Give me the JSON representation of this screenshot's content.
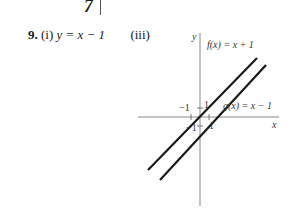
{
  "page_fragment": {
    "top_glyph": "7"
  },
  "problem": {
    "number": "9.",
    "part_i_label": "(i)",
    "part_i_answer": "y = x − 1",
    "part_iii_label": "(iii)"
  },
  "graph": {
    "y_axis_label": "y",
    "x_axis_label": "x",
    "f_label": "f(x) = x + 1",
    "g_label": "g(x) = x − 1",
    "tick_labels": {
      "f_x_intercept": "−1",
      "f_y_intercept": "1",
      "g_y_intercept": "−1",
      "g_x_intercept": "1"
    },
    "lines": [
      {
        "name": "f",
        "equation": "x + 1",
        "slope": 1,
        "intercept": 1
      },
      {
        "name": "g",
        "equation": "x − 1",
        "slope": 1,
        "intercept": -1
      }
    ],
    "line_color": "#1a1a1a",
    "axis_color": "#888888"
  }
}
